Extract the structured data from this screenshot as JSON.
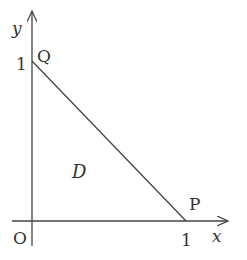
{
  "diagram": {
    "type": "coordinate-region",
    "axes": {
      "x_label": "x",
      "y_label": "y",
      "origin_label": "O"
    },
    "ticks": {
      "x_one": "1",
      "y_one": "1"
    },
    "points": {
      "Q": {
        "label": "Q",
        "coords": [
          0,
          1
        ]
      },
      "P": {
        "label": "P",
        "coords": [
          1,
          0
        ]
      }
    },
    "region": {
      "label": "D",
      "description": "triangle bounded by axes and line x + y = 1"
    },
    "colors": {
      "stroke": "#444444",
      "text": "#333333"
    }
  }
}
